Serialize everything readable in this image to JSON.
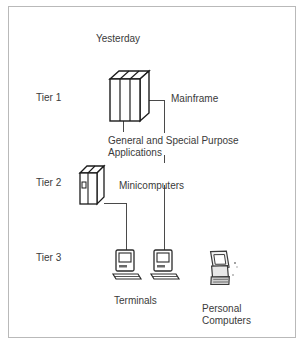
{
  "figure": {
    "title": "Yesterday",
    "border_color": "#b9b9b9",
    "line_color": "#4a4a4a",
    "text_color": "#3a3a3a",
    "background": "#ffffff"
  },
  "tiers": [
    {
      "label": "Tier 1"
    },
    {
      "label": "Tier 2"
    },
    {
      "label": "Tier 3"
    }
  ],
  "nodes": {
    "mainframe": {
      "label": "Mainframe",
      "icon": "mainframe-cabinet-icon"
    },
    "applications": {
      "line1": "General and Special Purpose",
      "line2": "Applications"
    },
    "minicomputers": {
      "label": "Minicomputers",
      "icon": "minicomputer-cabinet-icon"
    },
    "terminals": {
      "label": "Terminals",
      "icon": "terminal-icon"
    },
    "personal_computers": {
      "line1": "Personal",
      "line2": "Computers",
      "icon": "personal-computer-icon"
    }
  }
}
